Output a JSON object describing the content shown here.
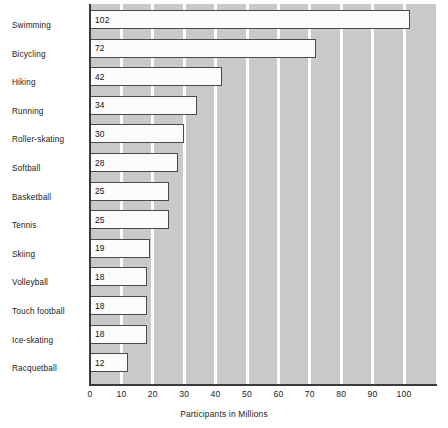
{
  "chart_data": {
    "type": "bar",
    "orientation": "horizontal",
    "title": "",
    "xlabel": "Participants in Millions",
    "ylabel": "",
    "xlim": [
      0,
      110
    ],
    "xticks": [
      0,
      10,
      20,
      30,
      40,
      50,
      60,
      70,
      80,
      90,
      100
    ],
    "xtick_labels": [
      "0",
      "10",
      "20",
      "30",
      "40",
      "50",
      "60",
      "70",
      "80",
      "90",
      "100"
    ],
    "grid": "vertical-white-gridlines",
    "legend": "none",
    "categories": [
      "Swimming",
      "Bicycling",
      "Hiking",
      "Running",
      "Roller-skating",
      "Softball",
      "Basketball",
      "Tennis",
      "Skiing",
      "Volleyball",
      "Touch football",
      "Ice-skating",
      "Racquetball"
    ],
    "values": [
      102,
      72,
      42,
      34,
      30,
      28,
      25,
      25,
      19,
      18,
      18,
      18,
      12
    ],
    "value_labels": [
      "102",
      "72",
      "42",
      "34",
      "30",
      "28",
      "25",
      "25",
      "19",
      "18",
      "18",
      "18",
      "12"
    ],
    "colors": {
      "plot_background": "#c9c9c9",
      "gridline": "#fdfdfd",
      "bar_fill": "#fbfbfb",
      "bar_border": "#4a4a4a",
      "axis_line": "#3a3a3a",
      "text": "#1a1a1a"
    }
  }
}
